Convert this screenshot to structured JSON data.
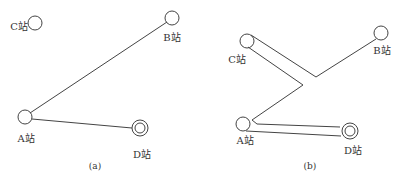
{
  "panels": [
    {
      "caption": "(a)",
      "stations": {
        "A": {
          "label": "A站"
        },
        "B": {
          "label": "B站"
        },
        "C": {
          "label": "C站"
        },
        "D": {
          "label": "D站"
        }
      }
    },
    {
      "caption": "(b)",
      "stations": {
        "A": {
          "label": "A站"
        },
        "B": {
          "label": "B站"
        },
        "C": {
          "label": "C站"
        },
        "D": {
          "label": "D站"
        }
      }
    }
  ],
  "colors": {
    "stroke": "#444444"
  }
}
